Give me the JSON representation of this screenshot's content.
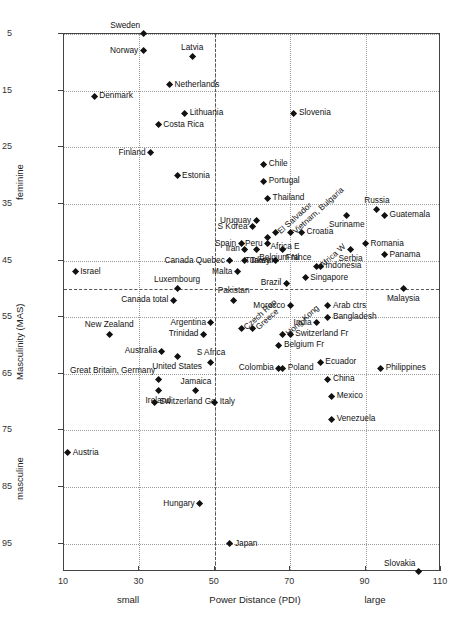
{
  "chart_data": {
    "type": "scatter",
    "title": "",
    "xlabel": "Power Distance (PDI)",
    "ylabel": "Masculinity (MAS)",
    "xlim": [
      10,
      110
    ],
    "ylim": [
      5,
      100
    ],
    "y_inverted": true,
    "grid": true,
    "legend": "none",
    "xticks": [
      "10",
      "30",
      "50",
      "70",
      "90",
      "110"
    ],
    "xtick_values": [
      10,
      30,
      50,
      70,
      90,
      110
    ],
    "yticks": [
      "5",
      "15",
      "25",
      "35",
      "45",
      "55",
      "65",
      "75",
      "85",
      "95"
    ],
    "ytick_values": [
      5,
      15,
      25,
      35,
      45,
      55,
      65,
      75,
      85,
      95
    ],
    "x_low_label": "small",
    "x_high_label": "large",
    "y_low_label": "feminine",
    "y_high_label": "masculine",
    "reference_lines": {
      "x": 50,
      "y": 50
    },
    "points": [
      {
        "name": "Sweden",
        "x": 31,
        "y": 5,
        "pos": "tl"
      },
      {
        "name": "Norway",
        "x": 31,
        "y": 8,
        "pos": "l"
      },
      {
        "name": "Latvia",
        "x": 44,
        "y": 9,
        "pos": "t"
      },
      {
        "name": "Netherlands",
        "x": 38,
        "y": 14,
        "pos": "r"
      },
      {
        "name": "Denmark",
        "x": 18,
        "y": 16,
        "pos": "r"
      },
      {
        "name": "Lithuania",
        "x": 42,
        "y": 19,
        "pos": "r"
      },
      {
        "name": "Costa Rica",
        "x": 35,
        "y": 21,
        "pos": "r"
      },
      {
        "name": "Slovenia",
        "x": 71,
        "y": 19,
        "pos": "r"
      },
      {
        "name": "Finland",
        "x": 33,
        "y": 26,
        "pos": "l"
      },
      {
        "name": "Estonia",
        "x": 40,
        "y": 30,
        "pos": "r"
      },
      {
        "name": "Chile",
        "x": 63,
        "y": 28,
        "pos": "r"
      },
      {
        "name": "Portugal",
        "x": 63,
        "y": 31,
        "pos": "r"
      },
      {
        "name": "Thailand",
        "x": 64,
        "y": 34,
        "pos": "r"
      },
      {
        "name": "Russia",
        "x": 93,
        "y": 36,
        "pos": "t"
      },
      {
        "name": "Guatemala",
        "x": 95,
        "y": 37,
        "pos": "r"
      },
      {
        "name": "Uruguay",
        "x": 61,
        "y": 38,
        "pos": "l"
      },
      {
        "name": "El Salvador",
        "x": 66,
        "y": 40,
        "pos": "rot"
      },
      {
        "name": "Vietnam, Bulgaria",
        "x": 70,
        "y": 40,
        "pos": "rot"
      },
      {
        "name": "Suriname",
        "x": 85,
        "y": 37,
        "pos": "b"
      },
      {
        "name": "S Korea",
        "x": 60,
        "y": 39,
        "pos": "l"
      },
      {
        "name": "Croatia",
        "x": 73,
        "y": 40,
        "pos": "r"
      },
      {
        "name": "Spain",
        "x": 57,
        "y": 42,
        "pos": "l"
      },
      {
        "name": "Peru",
        "x": 64,
        "y": 42,
        "pos": "l"
      },
      {
        "name": "Africa E",
        "x": 64,
        "y": 41,
        "pos": "br"
      },
      {
        "name": "France",
        "x": 68,
        "y": 43,
        "pos": "br"
      },
      {
        "name": "Iran",
        "x": 58,
        "y": 43,
        "pos": "l"
      },
      {
        "name": "Belgium Nl",
        "x": 61,
        "y": 43,
        "pos": "br"
      },
      {
        "name": "Africa W",
        "x": 77,
        "y": 46,
        "pos": "rot"
      },
      {
        "name": "Romania",
        "x": 90,
        "y": 42,
        "pos": "r"
      },
      {
        "name": "Serbia",
        "x": 86,
        "y": 43,
        "pos": "b"
      },
      {
        "name": "Panama",
        "x": 95,
        "y": 44,
        "pos": "r"
      },
      {
        "name": "Canada Quebec",
        "x": 54,
        "y": 45,
        "pos": "l"
      },
      {
        "name": "Taiwan",
        "x": 58,
        "y": 45,
        "pos": "r"
      },
      {
        "name": "Turkey",
        "x": 66,
        "y": 45,
        "pos": "l"
      },
      {
        "name": "Indonesia",
        "x": 78,
        "y": 46,
        "pos": "r"
      },
      {
        "name": "Israel",
        "x": 13,
        "y": 47,
        "pos": "r"
      },
      {
        "name": "Malta",
        "x": 56,
        "y": 47,
        "pos": "l"
      },
      {
        "name": "Singapore",
        "x": 74,
        "y": 48,
        "pos": "r"
      },
      {
        "name": "Luxembourg",
        "x": 40,
        "y": 50,
        "pos": "t"
      },
      {
        "name": "Brazil",
        "x": 69,
        "y": 49,
        "pos": "l"
      },
      {
        "name": "Malaysia",
        "x": 100,
        "y": 50,
        "pos": "b"
      },
      {
        "name": "Canada total",
        "x": 39,
        "y": 52,
        "pos": "l"
      },
      {
        "name": "Pakistan",
        "x": 55,
        "y": 52,
        "pos": "t"
      },
      {
        "name": "Morocco",
        "x": 70,
        "y": 53,
        "pos": "l"
      },
      {
        "name": "Arab ctrs",
        "x": 80,
        "y": 53,
        "pos": "r"
      },
      {
        "name": "Czech Rep",
        "x": 57,
        "y": 57,
        "pos": "rot"
      },
      {
        "name": "Greece",
        "x": 60,
        "y": 57,
        "pos": "rot"
      },
      {
        "name": "Bangladesh",
        "x": 80,
        "y": 55,
        "pos": "r"
      },
      {
        "name": "Argentina",
        "x": 49,
        "y": 56,
        "pos": "l"
      },
      {
        "name": "India",
        "x": 77,
        "y": 56,
        "pos": "l"
      },
      {
        "name": "New Zealand",
        "x": 22,
        "y": 58,
        "pos": "t"
      },
      {
        "name": "Trinidad",
        "x": 47,
        "y": 58,
        "pos": "l"
      },
      {
        "name": "Hong Kong",
        "x": 68,
        "y": 58,
        "pos": "rot"
      },
      {
        "name": "Switzerland Fr",
        "x": 70,
        "y": 58,
        "pos": "r"
      },
      {
        "name": "Belgium Fr",
        "x": 67,
        "y": 60,
        "pos": "r"
      },
      {
        "name": "Australia",
        "x": 36,
        "y": 61,
        "pos": "l"
      },
      {
        "name": "S Africa",
        "x": 49,
        "y": 63,
        "pos": "t"
      },
      {
        "name": "United States",
        "x": 40,
        "y": 62,
        "pos": "b"
      },
      {
        "name": "Colombia",
        "x": 67,
        "y": 64,
        "pos": "l"
      },
      {
        "name": "Poland",
        "x": 68,
        "y": 64,
        "pos": "r"
      },
      {
        "name": "Ecuador",
        "x": 78,
        "y": 63,
        "pos": "r"
      },
      {
        "name": "Philippines",
        "x": 94,
        "y": 64,
        "pos": "r"
      },
      {
        "name": "Great Britain, Germany",
        "x": 35,
        "y": 66,
        "pos": "tl"
      },
      {
        "name": "Jamaica",
        "x": 45,
        "y": 68,
        "pos": "t"
      },
      {
        "name": "China",
        "x": 80,
        "y": 66,
        "pos": "r"
      },
      {
        "name": "Ireland",
        "x": 35,
        "y": 68,
        "pos": "b"
      },
      {
        "name": "Italy",
        "x": 50,
        "y": 70,
        "pos": "r"
      },
      {
        "name": "Mexico",
        "x": 81,
        "y": 69,
        "pos": "r"
      },
      {
        "name": "Switzerland Ge",
        "x": 34,
        "y": 70,
        "pos": "r"
      },
      {
        "name": "Venezuela",
        "x": 81,
        "y": 73,
        "pos": "r"
      },
      {
        "name": "Austria",
        "x": 11,
        "y": 79,
        "pos": "r"
      },
      {
        "name": "Hungary",
        "x": 46,
        "y": 88,
        "pos": "l"
      },
      {
        "name": "Japan",
        "x": 54,
        "y": 95,
        "pos": "r"
      },
      {
        "name": "Slovakia",
        "x": 104,
        "y": 100,
        "pos": "tl"
      }
    ]
  }
}
